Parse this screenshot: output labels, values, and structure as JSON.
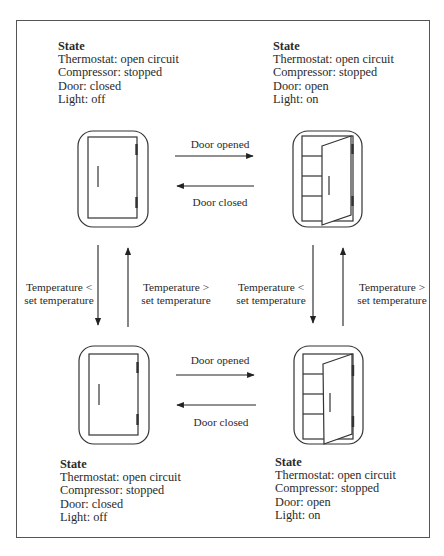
{
  "states": {
    "top_left": {
      "title": "State",
      "thermostat": "Thermostat: open circuit",
      "compressor": "Compressor: stopped",
      "door": "Door: closed",
      "light": "Light: off"
    },
    "top_right": {
      "title": "State",
      "thermostat": "Thermostat: open circuit",
      "compressor": "Compressor: stopped",
      "door": "Door: open",
      "light": "Light: on"
    },
    "bottom_left": {
      "title": "State",
      "thermostat": "Thermostat: open circuit",
      "compressor": "Compressor: stopped",
      "door": "Door: closed",
      "light": "Light: off"
    },
    "bottom_right": {
      "title": "State",
      "thermostat": "Thermostat: open circuit",
      "compressor": "Compressor: stopped",
      "door": "Door: open",
      "light": "Light: on"
    }
  },
  "transitions": {
    "top_opened": "Door opened",
    "top_closed": "Door closed",
    "bottom_opened": "Door opened",
    "bottom_closed": "Door closed",
    "left_down_line1": "Temperature <",
    "left_down_line2": "set temperature",
    "left_up_line1": "Temperature >",
    "left_up_line2": "set temperature",
    "right_down_line1": "Temperature <",
    "right_down_line2": "set temperature",
    "right_up_line1": "Temperature >",
    "right_up_line2": "set temperature"
  },
  "icons": {
    "closed_fridge": "refrigerator-closed-icon",
    "open_fridge": "refrigerator-open-icon"
  }
}
